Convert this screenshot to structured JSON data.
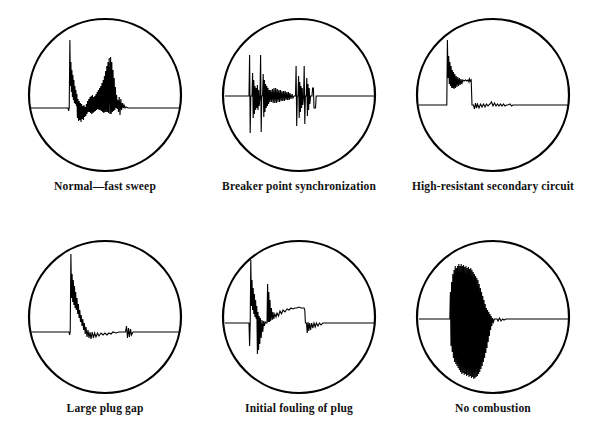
{
  "figure": {
    "background_color": "#ffffff",
    "ink_color": "#000000",
    "layout": {
      "rows": 2,
      "columns": 3,
      "panel_count": 6
    }
  },
  "panels": [
    {
      "id": "normal-fast-sweep",
      "label": "Normal—fast sweep",
      "row": 1,
      "column": 1,
      "scope": {
        "shape": "circle",
        "baseline": "horizontal trace across full diameter",
        "description": "Tall narrow firing spike rising above baseline with dense ringing, descending into a burst of spark-line oscillation, a secondary medium spike, then damped coil oscillations settling to flat baseline."
      }
    },
    {
      "id": "breaker-point-synchronization",
      "label": "Breaker point synchronization",
      "row": 1,
      "column": 2,
      "scope": {
        "shape": "circle",
        "baseline": "horizontal trace across full diameter",
        "description": "Two tall paired vertical spikes extending above and below baseline, followed by a dense oscillating spark band, a second pair of spikes, a small dip, then flat baseline."
      }
    },
    {
      "id": "high-resistant-secondary-circuit",
      "label": "High-resistant secondary circuit",
      "row": 1,
      "column": 3,
      "scope": {
        "shape": "circle",
        "baseline": "horizontal trace across full diameter",
        "description": "Single tall firing spike that decays into a long elevated sloping spark line, dropping sharply to baseline with low-amplitude coil oscillations, then flat."
      }
    },
    {
      "id": "large-plug-gap",
      "label": "Large plug gap",
      "row": 2,
      "column": 1,
      "scope": {
        "shape": "circle",
        "baseline": "horizontal trace across full diameter",
        "description": "Very tall sharp firing spike with minimal ringing, a short spark line close to baseline, small coil oscillation group, then flat baseline."
      }
    },
    {
      "id": "initial-fouling-of-plug",
      "label": "Initial fouling of plug",
      "row": 2,
      "column": 2,
      "scope": {
        "shape": "circle",
        "baseline": "horizontal trace across full diameter",
        "description": "Tall firing spike going above and below baseline, a secondary spike, then a long rounded elevated spark line that drops to baseline with small oscillations, then flat."
      }
    },
    {
      "id": "no-combustion",
      "label": "No combustion",
      "row": 2,
      "column": 3,
      "scope": {
        "shape": "circle",
        "baseline": "horizontal trace across full diameter",
        "description": "Dense block of high-frequency oscillation extending far above and below baseline with no spark line, followed by a small ripple and flat baseline."
      }
    }
  ]
}
